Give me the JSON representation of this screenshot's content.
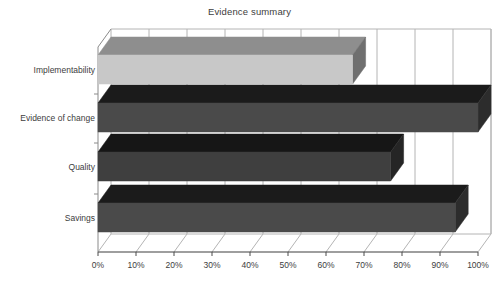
{
  "chart_data": {
    "type": "bar",
    "orientation": "horizontal",
    "style": "3d-bar",
    "title": "Evidence summary",
    "xlabel": "",
    "ylabel": "",
    "categories": [
      "Savings",
      "Quality",
      "Evidence of change",
      "Implementability"
    ],
    "values": [
      94,
      77,
      100,
      67
    ],
    "value_labels": [
      "94%",
      "77%",
      "100%",
      "67%"
    ],
    "series": [
      {
        "name": "Evidence summary",
        "values": [
          94,
          77,
          100,
          67
        ]
      }
    ],
    "xlim": [
      0,
      100
    ],
    "xtick_values": [
      0,
      10,
      20,
      30,
      40,
      50,
      60,
      70,
      80,
      90,
      100
    ],
    "xtick_labels": [
      "0%",
      "10%",
      "20%",
      "30%",
      "40%",
      "50%",
      "60%",
      "70%",
      "80%",
      "90%",
      "100%"
    ],
    "grid": true,
    "grid_axis": "x",
    "legend": false,
    "legend_position": "none",
    "bar_colors": {
      "Savings": "#4a4a4a",
      "Quality": "#3f3f3f",
      "Evidence of change": "#4a4a4a",
      "Implementability": "#c8c8c8"
    },
    "bars": [
      {
        "category": "Implementability",
        "value": 67,
        "value_label": "67%",
        "face_color": "#c8c8c8",
        "top_color": "#8e8e8e",
        "side_color": "#6f6f6f"
      },
      {
        "category": "Evidence of change",
        "value": 100,
        "value_label": "100%",
        "face_color": "#4a4a4a",
        "top_color": "#1b1b1b",
        "side_color": "#2c2c2c"
      },
      {
        "category": "Quality",
        "value": 77,
        "value_label": "77%",
        "face_color": "#3f3f3f",
        "top_color": "#161616",
        "side_color": "#252525"
      },
      {
        "category": "Savings",
        "value": 94,
        "value_label": "94%",
        "face_color": "#4a4a4a",
        "top_color": "#1b1b1b",
        "side_color": "#2c2c2c"
      }
    ],
    "colors": {
      "background": "#ffffff",
      "gridline": "#b4b4b4",
      "axis": "#8a8a8a",
      "text": "#3d3d3d"
    }
  },
  "chart": {
    "title": "Evidence summary"
  },
  "axis_y": {
    "labels": [
      {
        "text": "Implementability"
      },
      {
        "text": "Evidence of change"
      },
      {
        "text": "Quality"
      },
      {
        "text": "Savings"
      }
    ]
  },
  "axis_x": {
    "labels": [
      {
        "text": "0%"
      },
      {
        "text": "10%"
      },
      {
        "text": "20%"
      },
      {
        "text": "30%"
      },
      {
        "text": "40%"
      },
      {
        "text": "50%"
      },
      {
        "text": "60%"
      },
      {
        "text": "70%"
      },
      {
        "text": "80%"
      },
      {
        "text": "90%"
      },
      {
        "text": "100%"
      }
    ]
  }
}
